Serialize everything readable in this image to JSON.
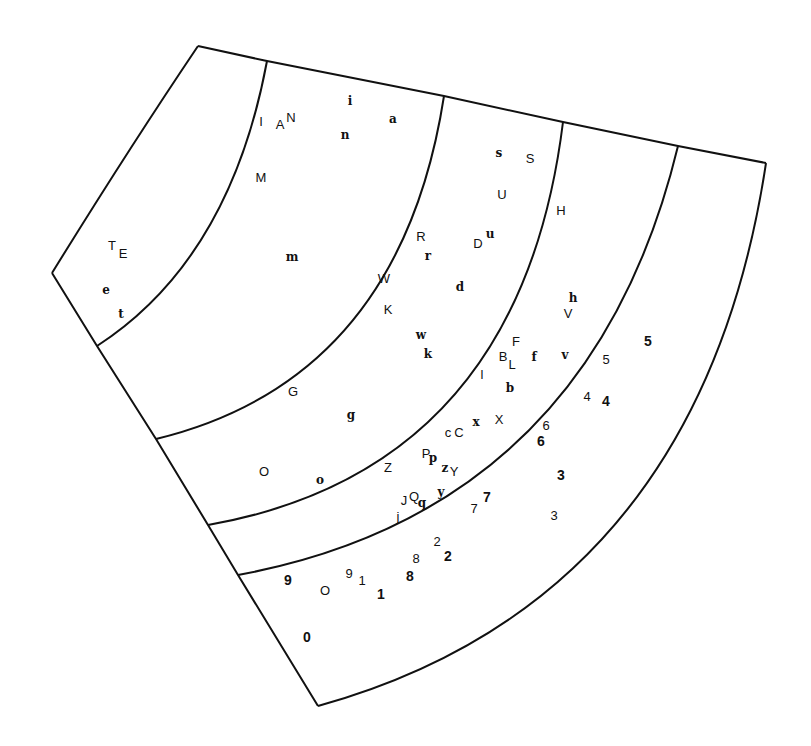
{
  "figure": {
    "type": "annular-sector-diagram",
    "bands": 6,
    "outline_color": "#111111"
  },
  "glyphs": [
    {
      "t": "T",
      "x": 112,
      "y": 245,
      "s": "sans"
    },
    {
      "t": "E",
      "x": 123,
      "y": 253,
      "s": "sans"
    },
    {
      "t": "e",
      "x": 106,
      "y": 290,
      "s": "serif"
    },
    {
      "t": "t",
      "x": 121,
      "y": 314,
      "s": "serif"
    },
    {
      "t": "I",
      "x": 261,
      "y": 121,
      "s": "sans"
    },
    {
      "t": "A",
      "x": 280,
      "y": 124,
      "s": "sans"
    },
    {
      "t": "N",
      "x": 291,
      "y": 117,
      "s": "sans"
    },
    {
      "t": "i",
      "x": 350,
      "y": 101,
      "s": "serif"
    },
    {
      "t": "a",
      "x": 393,
      "y": 119,
      "s": "serif"
    },
    {
      "t": "n",
      "x": 345,
      "y": 135,
      "s": "serif"
    },
    {
      "t": "M",
      "x": 261,
      "y": 177,
      "s": "sans"
    },
    {
      "t": "m",
      "x": 292,
      "y": 257,
      "s": "serif"
    },
    {
      "t": "s",
      "x": 499,
      "y": 153,
      "s": "serif"
    },
    {
      "t": "S",
      "x": 530,
      "y": 158,
      "s": "sans"
    },
    {
      "t": "U",
      "x": 502,
      "y": 194,
      "s": "sans"
    },
    {
      "t": "R",
      "x": 421,
      "y": 236,
      "s": "sans"
    },
    {
      "t": "r",
      "x": 428,
      "y": 256,
      "s": "serif"
    },
    {
      "t": "D",
      "x": 478,
      "y": 243,
      "s": "sans"
    },
    {
      "t": "u",
      "x": 490,
      "y": 234,
      "s": "serif"
    },
    {
      "t": "W",
      "x": 384,
      "y": 278,
      "s": "sans"
    },
    {
      "t": "d",
      "x": 460,
      "y": 287,
      "s": "serif"
    },
    {
      "t": "K",
      "x": 388,
      "y": 309,
      "s": "sans"
    },
    {
      "t": "w",
      "x": 421,
      "y": 335,
      "s": "serif"
    },
    {
      "t": "k",
      "x": 428,
      "y": 354,
      "s": "serif"
    },
    {
      "t": "G",
      "x": 293,
      "y": 391,
      "s": "sans"
    },
    {
      "t": "g",
      "x": 351,
      "y": 415,
      "s": "serif"
    },
    {
      "t": "O",
      "x": 264,
      "y": 471,
      "s": "sans"
    },
    {
      "t": "o",
      "x": 320,
      "y": 480,
      "s": "serif"
    },
    {
      "t": "H",
      "x": 561,
      "y": 210,
      "s": "sans"
    },
    {
      "t": "h",
      "x": 573,
      "y": 298,
      "s": "serif"
    },
    {
      "t": "V",
      "x": 568,
      "y": 313,
      "s": "sans"
    },
    {
      "t": "F",
      "x": 516,
      "y": 341,
      "s": "sans"
    },
    {
      "t": "B",
      "x": 503,
      "y": 356,
      "s": "sans"
    },
    {
      "t": "L",
      "x": 512,
      "y": 364,
      "s": "sans"
    },
    {
      "t": "f",
      "x": 534,
      "y": 357,
      "s": "serif"
    },
    {
      "t": "v",
      "x": 565,
      "y": 355,
      "s": "serif"
    },
    {
      "t": "l",
      "x": 482,
      "y": 374,
      "s": "sans"
    },
    {
      "t": "b",
      "x": 510,
      "y": 388,
      "s": "serif"
    },
    {
      "t": "X",
      "x": 499,
      "y": 419,
      "s": "sans"
    },
    {
      "t": "x",
      "x": 476,
      "y": 422,
      "s": "serif"
    },
    {
      "t": "c",
      "x": 448,
      "y": 432,
      "s": "sans"
    },
    {
      "t": "C",
      "x": 459,
      "y": 432,
      "s": "sans"
    },
    {
      "t": "Z",
      "x": 388,
      "y": 467,
      "s": "sans"
    },
    {
      "t": "P",
      "x": 426,
      "y": 453,
      "s": "sans"
    },
    {
      "t": "p",
      "x": 433,
      "y": 458,
      "s": "serif"
    },
    {
      "t": "z",
      "x": 445,
      "y": 468,
      "s": "serif"
    },
    {
      "t": "Y",
      "x": 454,
      "y": 471,
      "s": "sans"
    },
    {
      "t": "y",
      "x": 441,
      "y": 492,
      "s": "serif"
    },
    {
      "t": "J",
      "x": 404,
      "y": 500,
      "s": "sans"
    },
    {
      "t": "Q",
      "x": 414,
      "y": 496,
      "s": "sans"
    },
    {
      "t": "q",
      "x": 422,
      "y": 503,
      "s": "serif"
    },
    {
      "t": "j",
      "x": 398,
      "y": 516,
      "s": "sans"
    },
    {
      "t": "5",
      "x": 606,
      "y": 359,
      "s": "sans"
    },
    {
      "t": "5",
      "x": 648,
      "y": 341,
      "s": "boldnum"
    },
    {
      "t": "4",
      "x": 587,
      "y": 396,
      "s": "sans"
    },
    {
      "t": "4",
      "x": 606,
      "y": 401,
      "s": "boldnum"
    },
    {
      "t": "6",
      "x": 546,
      "y": 425,
      "s": "sans"
    },
    {
      "t": "6",
      "x": 541,
      "y": 441,
      "s": "boldnum"
    },
    {
      "t": "3",
      "x": 561,
      "y": 475,
      "s": "boldnum"
    },
    {
      "t": "3",
      "x": 554,
      "y": 515,
      "s": "sans"
    },
    {
      "t": "7",
      "x": 487,
      "y": 497,
      "s": "boldnum"
    },
    {
      "t": "7",
      "x": 474,
      "y": 508,
      "s": "sans"
    },
    {
      "t": "2",
      "x": 437,
      "y": 541,
      "s": "sans"
    },
    {
      "t": "2",
      "x": 448,
      "y": 556,
      "s": "boldnum"
    },
    {
      "t": "8",
      "x": 416,
      "y": 558,
      "s": "sans"
    },
    {
      "t": "8",
      "x": 410,
      "y": 576,
      "s": "boldnum"
    },
    {
      "t": "9",
      "x": 349,
      "y": 573,
      "s": "sans"
    },
    {
      "t": "1",
      "x": 362,
      "y": 580,
      "s": "sans"
    },
    {
      "t": "1",
      "x": 381,
      "y": 594,
      "s": "boldnum"
    },
    {
      "t": "9",
      "x": 288,
      "y": 580,
      "s": "boldnum"
    },
    {
      "t": "O",
      "x": 325,
      "y": 590,
      "s": "sans"
    },
    {
      "t": "0",
      "x": 307,
      "y": 637,
      "s": "boldnum"
    }
  ]
}
